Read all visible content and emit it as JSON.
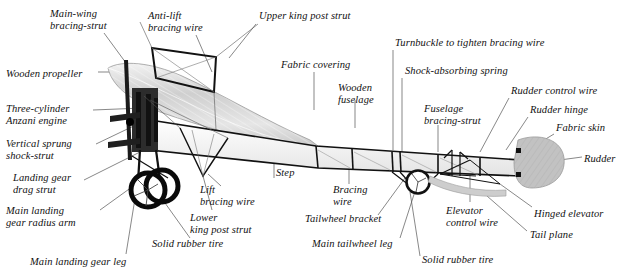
{
  "figure": {
    "background_color": "#ffffff",
    "ink_color": "#111111",
    "wing_fill": "#d8d8d8",
    "rudder_fill": "#b9b9b9"
  },
  "labels": [
    {
      "id": "main-wing-bracing-strut",
      "text": "Main-wing\nbracing-strut",
      "x": 50,
      "y": 8,
      "align": "left"
    },
    {
      "id": "anti-lift-bracing-wire",
      "text": "Anti-lift\nbracing wire",
      "x": 148,
      "y": 10,
      "align": "left"
    },
    {
      "id": "upper-king-post-strut",
      "text": "Upper king post strut",
      "x": 259,
      "y": 10,
      "align": "left"
    },
    {
      "id": "wooden-propeller",
      "text": "Wooden propeller",
      "x": 6,
      "y": 68,
      "align": "left"
    },
    {
      "id": "fabric-covering",
      "text": "Fabric covering",
      "x": 281,
      "y": 59,
      "align": "left"
    },
    {
      "id": "turnbuckle-bracing-wire",
      "text": "Turnbuckle to tighten bracing wire",
      "x": 395,
      "y": 37,
      "align": "left"
    },
    {
      "id": "shock-absorbing-spring",
      "text": "Shock-absorbing spring",
      "x": 405,
      "y": 65,
      "align": "left"
    },
    {
      "id": "wooden-fuselage",
      "text": "Wooden\nfuselage",
      "x": 338,
      "y": 82,
      "align": "left"
    },
    {
      "id": "rudder-control-wire",
      "text": "Rudder control wire",
      "x": 511,
      "y": 85,
      "align": "left"
    },
    {
      "id": "three-cylinder-anzani-engine",
      "text": "Three-cylinder\nAnzani engine",
      "x": 6,
      "y": 103,
      "align": "left"
    },
    {
      "id": "fuselage-bracing-strut",
      "text": "Fuselage\nbracing-strut",
      "x": 424,
      "y": 103,
      "align": "left"
    },
    {
      "id": "rudder-hinge",
      "text": "Rudder hinge",
      "x": 530,
      "y": 104,
      "align": "left"
    },
    {
      "id": "fabric-skin",
      "text": "Fabric skin",
      "x": 556,
      "y": 122,
      "align": "left"
    },
    {
      "id": "vertical-sprung-shock-strut",
      "text": "Vertical sprung\nshock-strut",
      "x": 6,
      "y": 138,
      "align": "left"
    },
    {
      "id": "rudder",
      "text": "Rudder",
      "x": 584,
      "y": 153,
      "align": "left"
    },
    {
      "id": "landing-gear-drag-strut",
      "text": "Landing gear\ndrag strut",
      "x": 13,
      "y": 172,
      "align": "left"
    },
    {
      "id": "step",
      "text": "Step",
      "x": 276,
      "y": 167,
      "align": "left"
    },
    {
      "id": "lift-bracing-wire",
      "text": "Lift\nbracing wire",
      "x": 200,
      "y": 184,
      "align": "left"
    },
    {
      "id": "bracing-wire",
      "text": "Bracing\nwire",
      "x": 333,
      "y": 184,
      "align": "left"
    },
    {
      "id": "main-landing-gear-radius-arm",
      "text": "Main landing\ngear radius arm",
      "x": 6,
      "y": 205,
      "align": "left"
    },
    {
      "id": "lower-king-post-strut",
      "text": "Lower\nking post strut",
      "x": 190,
      "y": 212,
      "align": "left"
    },
    {
      "id": "tailwheel-bracket",
      "text": "Tailwheel bracket",
      "x": 305,
      "y": 213,
      "align": "left"
    },
    {
      "id": "elevator-control-wire",
      "text": "Elevator\ncontrol wire",
      "x": 446,
      "y": 205,
      "align": "left"
    },
    {
      "id": "hinged-elevator",
      "text": "Hinged elevator",
      "x": 534,
      "y": 208,
      "align": "left"
    },
    {
      "id": "tail-plane",
      "text": "Tail plane",
      "x": 530,
      "y": 229,
      "align": "left"
    },
    {
      "id": "solid-rubber-tire-left",
      "text": "Solid rubber tire",
      "x": 152,
      "y": 238,
      "align": "left"
    },
    {
      "id": "main-tailwheel-leg",
      "text": "Main tailwheel leg",
      "x": 312,
      "y": 238,
      "align": "left"
    },
    {
      "id": "solid-rubber-tire-right",
      "text": "Solid rubber tire",
      "x": 422,
      "y": 254,
      "align": "left"
    },
    {
      "id": "main-landing-gear-leg",
      "text": "Main landing gear leg",
      "x": 30,
      "y": 256,
      "align": "left"
    }
  ]
}
